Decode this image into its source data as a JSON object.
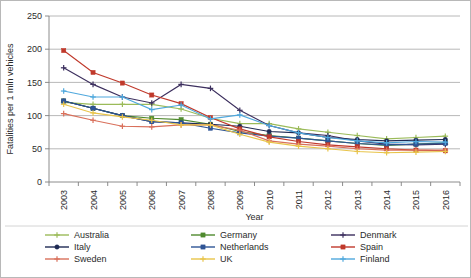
{
  "chart_data": {
    "type": "line",
    "title": "",
    "xlabel": "Year",
    "ylabel": "Fatalities per 1 mln vehicles",
    "x": [
      2003,
      2004,
      2005,
      2006,
      2007,
      2008,
      2009,
      2010,
      2011,
      2012,
      2013,
      2014,
      2015,
      2016
    ],
    "xtick_labels": [
      "2003",
      "2004",
      "2005",
      "2006",
      "2007",
      "2008",
      "2009",
      "2010",
      "2011",
      "2012",
      "2013",
      "2014",
      "2015",
      "2016"
    ],
    "ytick_labels": [
      "0",
      "50",
      "100",
      "150",
      "200",
      "250"
    ],
    "ylim": [
      0,
      250
    ],
    "ytick_step": 50,
    "grid": "horizontal",
    "legend_position": "bottom",
    "series": [
      {
        "name": "Australia",
        "color": "#9bbb59",
        "marker": "plus",
        "values": [
          120,
          117,
          117,
          117,
          110,
          96,
          88,
          88,
          80,
          75,
          70,
          65,
          67,
          69
        ]
      },
      {
        "name": "Germany",
        "color": "#4f8a2e",
        "marker": "square",
        "values": [
          122,
          111,
          100,
          96,
          94,
          87,
          76,
          70,
          66,
          62,
          58,
          55,
          57,
          59
        ]
      },
      {
        "name": "Denmark",
        "color": "#3c2f5e",
        "marker": "plus",
        "values": [
          172,
          147,
          128,
          119,
          147,
          141,
          108,
          85,
          74,
          70,
          62,
          57,
          56,
          57
        ]
      },
      {
        "name": "Italy",
        "color": "#1f2a54",
        "marker": "circle",
        "values": [
          122,
          111,
          100,
          91,
          89,
          87,
          84,
          76,
          74,
          67,
          64,
          62,
          63,
          64
        ]
      },
      {
        "name": "Netherlands",
        "color": "#2f5596",
        "marker": "square",
        "values": [
          122,
          111,
          100,
          91,
          89,
          81,
          74,
          69,
          66,
          62,
          58,
          56,
          57,
          58
        ]
      },
      {
        "name": "Spain",
        "color": "#c0392b",
        "marker": "square",
        "values": [
          198,
          165,
          149,
          131,
          118,
          97,
          80,
          68,
          61,
          56,
          53,
          50,
          48,
          47
        ]
      },
      {
        "name": "Sweden",
        "color": "#d9705b",
        "marker": "plus",
        "values": [
          103,
          93,
          84,
          83,
          86,
          86,
          78,
          62,
          57,
          54,
          50,
          48,
          48,
          48
        ]
      },
      {
        "name": "UK",
        "color": "#e8c44a",
        "marker": "plus",
        "values": [
          117,
          104,
          98,
          93,
          86,
          86,
          72,
          60,
          54,
          50,
          46,
          44,
          45,
          46
        ]
      },
      {
        "name": "Finland",
        "color": "#4fa8dd",
        "marker": "plus",
        "values": [
          137,
          128,
          128,
          109,
          116,
          95,
          101,
          85,
          74,
          67,
          62,
          59,
          61,
          60
        ]
      }
    ]
  },
  "legend": {
    "entries": [
      {
        "label": "Australia"
      },
      {
        "label": "Germany"
      },
      {
        "label": "Denmark"
      },
      {
        "label": "Italy"
      },
      {
        "label": "Netherlands"
      },
      {
        "label": "Spain"
      },
      {
        "label": "Sweden"
      },
      {
        "label": "UK"
      },
      {
        "label": "Finland"
      }
    ]
  }
}
